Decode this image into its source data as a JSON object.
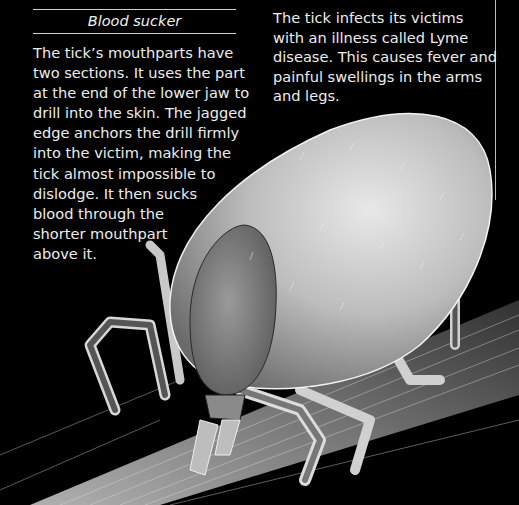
{
  "sidebar_box": {
    "heading": "Blood sucker",
    "lines": [
      "The tick’s mouthparts have",
      "two sections. It uses the part",
      "at the end of the lower jaw to",
      "drill into the skin. The jagged",
      "edge anchors the drill firmly",
      "into the victim, making the",
      "tick almost impossible to",
      "dislodge. It then sucks",
      "blood through the",
      "shorter mouthpart",
      "above it."
    ]
  },
  "caption": {
    "lines": [
      "The tick infects its victims",
      "with an illness called Lyme",
      "disease. This causes fever and",
      "painful swellings in the arms",
      "and legs."
    ]
  },
  "image": {
    "subject": "electron micrograph of a tick on a hair/stem",
    "background_color": "#000000"
  }
}
